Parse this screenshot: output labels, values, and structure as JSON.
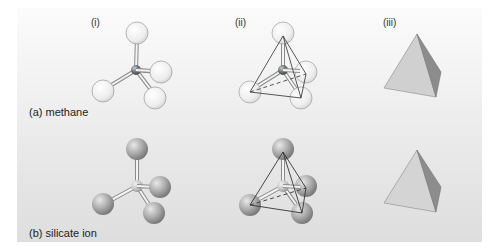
{
  "columns": [
    {
      "label": "(i)",
      "description": "ball-and-stick model"
    },
    {
      "label": "(ii)",
      "description": "ball-and-stick model with tetrahedron outline"
    },
    {
      "label": "(iii)",
      "description": "solid tetrahedron"
    }
  ],
  "rows": [
    {
      "label": "(a) methane",
      "center_atom_color": "#6e7478",
      "outer_atom_color": "#f2f2f2"
    },
    {
      "label": "(b) silicate ion",
      "center_atom_color": "#c4c4c4",
      "outer_atom_color": "#a8a8a8"
    }
  ],
  "colors": {
    "background_top": "#fbfbfb",
    "background_bottom": "#dedede",
    "tetra_light_face": "#d2d2d2",
    "tetra_dark_face": "#8a8a8a",
    "edge": "#444444"
  }
}
